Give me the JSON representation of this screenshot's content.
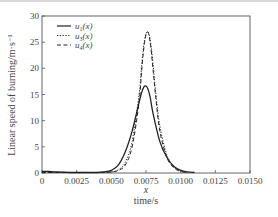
{
  "chart_data": {
    "type": "line",
    "title": "",
    "xlabel": "x\ntime/s",
    "xlabel_var": "x",
    "xlabel_unit": "time/s",
    "ylabel": "Linear speed of burning/m·s⁻¹",
    "xlim": [
      0,
      0.015
    ],
    "ylim": [
      0,
      30
    ],
    "xticks": [
      "0",
      "0.0025",
      "0.0050",
      "0.0075",
      "0.0100",
      "0.0125",
      "0.0150"
    ],
    "yticks": [
      "0",
      "5",
      "10",
      "15",
      "20",
      "25",
      "30"
    ],
    "grid": false,
    "legend_position": "upper left",
    "series": [
      {
        "name": "u1(x)",
        "label_base": "u",
        "label_sub": "1",
        "style": "solid",
        "x": [
          0,
          0.0005,
          0.001,
          0.002,
          0.003,
          0.004,
          0.0045,
          0.005,
          0.0055,
          0.006,
          0.0065,
          0.007,
          0.0072,
          0.0074,
          0.0076,
          0.0078,
          0.008,
          0.0085,
          0.009,
          0.0095,
          0.01,
          0.0105,
          0.011
        ],
        "y": [
          0.3,
          0.3,
          0.2,
          0.1,
          0.1,
          0.1,
          0.2,
          0.5,
          1.5,
          4,
          8,
          13.5,
          15.5,
          16.6,
          16.3,
          14.5,
          11.5,
          6,
          3,
          1.3,
          0.5,
          0.2,
          0.1
        ]
      },
      {
        "name": "u3(x)",
        "label_base": "u",
        "label_sub": "3",
        "style": "dotted",
        "x": [
          0,
          0.001,
          0.002,
          0.003,
          0.004,
          0.005,
          0.0055,
          0.006,
          0.0065,
          0.007,
          0.0072,
          0.0074,
          0.0076,
          0.0078,
          0.008,
          0.0082,
          0.0085,
          0.009,
          0.0095,
          0.01,
          0.0105
        ],
        "y": [
          0.1,
          0.1,
          0.1,
          0.1,
          0.1,
          0.2,
          0.6,
          2,
          6,
          15,
          21,
          25.5,
          27,
          25.5,
          21,
          15.5,
          9,
          3.5,
          1.2,
          0.4,
          0.1
        ]
      },
      {
        "name": "u4(x)",
        "label_base": "u",
        "label_sub": "4",
        "style": "dashed",
        "x": [
          0,
          0.001,
          0.002,
          0.003,
          0.004,
          0.005,
          0.0055,
          0.006,
          0.0065,
          0.007,
          0.0072,
          0.0074,
          0.0076,
          0.0078,
          0.008,
          0.0082,
          0.0085,
          0.009,
          0.0095,
          0.01,
          0.0105
        ],
        "y": [
          0.1,
          0.1,
          0.1,
          0.1,
          0.1,
          0.2,
          0.5,
          1.5,
          5,
          13.5,
          20,
          25,
          27,
          25,
          20,
          14.5,
          8,
          3,
          1,
          0.3,
          0.1
        ]
      }
    ]
  },
  "colors": {
    "line": "#222222",
    "axis": "#555555",
    "text": "#444444"
  }
}
